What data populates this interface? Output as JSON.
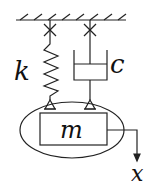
{
  "diagram": {
    "labels": {
      "spring": "k",
      "damper": "c",
      "mass": "m",
      "displacement": "x"
    },
    "colors": {
      "stroke": "#222222",
      "background": "#ffffff"
    }
  }
}
